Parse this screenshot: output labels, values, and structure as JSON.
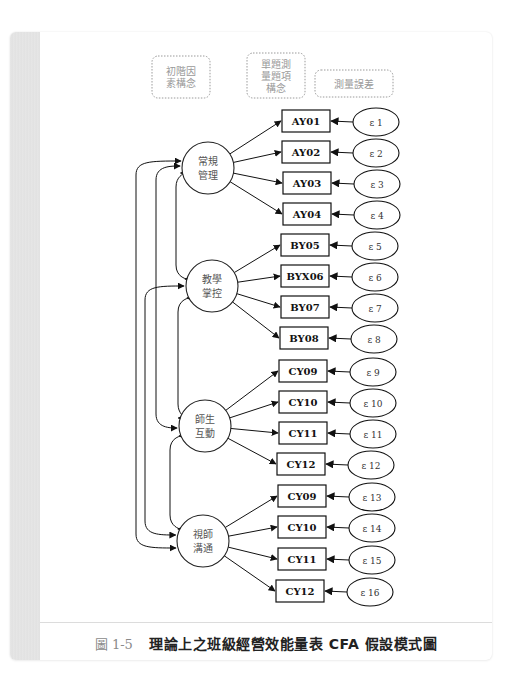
{
  "legend": {
    "first_order_factor": [
      "初階因",
      "素構念"
    ],
    "single_item_construct": [
      "單題測",
      "量題項",
      "構念"
    ],
    "measurement_error": [
      "測量誤差"
    ]
  },
  "colors": {
    "line": "#111111",
    "legend_border": "#9a9a9a",
    "caption_number": "#8a8a8a",
    "divider": "#dcdcdc"
  },
  "factors": [
    {
      "label": [
        "常規",
        "管理"
      ],
      "cx": 208,
      "cy": 168
    },
    {
      "label": [
        "教學",
        "掌控"
      ],
      "cx": 212,
      "cy": 286
    },
    {
      "label": [
        "師生",
        "互動"
      ],
      "cx": 205,
      "cy": 426
    },
    {
      "label": [
        "視師",
        "溝通"
      ],
      "cx": 203,
      "cy": 541
    }
  ],
  "items": [
    {
      "label": "AY01",
      "error": "ε 1",
      "factor": 0,
      "x": 282,
      "y": 110
    },
    {
      "label": "AY02",
      "error": "ε 2",
      "factor": 0,
      "x": 282,
      "y": 141
    },
    {
      "label": "AY03",
      "error": "ε 3",
      "factor": 0,
      "x": 283,
      "y": 172
    },
    {
      "label": "AY04",
      "error": "ε 4",
      "factor": 0,
      "x": 283,
      "y": 203
    },
    {
      "label": "BY05",
      "error": "ε 5",
      "factor": 1,
      "x": 281,
      "y": 234
    },
    {
      "label": "BYX06",
      "error": "ε 6",
      "factor": 1,
      "x": 281,
      "y": 265
    },
    {
      "label": "BY07",
      "error": "ε 7",
      "factor": 1,
      "x": 281,
      "y": 296
    },
    {
      "label": "BY08",
      "error": "ε 8",
      "factor": 1,
      "x": 280,
      "y": 327
    },
    {
      "label": "CY09",
      "error": "ε 9",
      "factor": 2,
      "x": 279,
      "y": 360
    },
    {
      "label": "CY10",
      "error": "ε 10",
      "factor": 2,
      "x": 279,
      "y": 391
    },
    {
      "label": "CY11",
      "error": "ε 11",
      "factor": 2,
      "x": 279,
      "y": 422
    },
    {
      "label": "CY12",
      "error": "ε 12",
      "factor": 2,
      "x": 277,
      "y": 453
    },
    {
      "label": "CY09",
      "error": "ε 13",
      "factor": 3,
      "x": 278,
      "y": 485
    },
    {
      "label": "CY10",
      "error": "ε 14",
      "factor": 3,
      "x": 278,
      "y": 516
    },
    {
      "label": "CY11",
      "error": "ε 15",
      "factor": 3,
      "x": 278,
      "y": 548
    },
    {
      "label": "CY12",
      "error": "ε 16",
      "factor": 3,
      "x": 276,
      "y": 580
    }
  ],
  "caption": {
    "number": "圖 1-5",
    "title": "理論上之班級經營效能量表 CFA 假設模式圖"
  }
}
